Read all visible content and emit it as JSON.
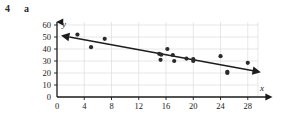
{
  "exercise": {
    "number": "4",
    "part": "a"
  },
  "chart_data": {
    "type": "scatter",
    "title": "",
    "xlabel": "x",
    "ylabel": "y",
    "xlim": [
      0,
      29.5
    ],
    "ylim": [
      0,
      60
    ],
    "grid": true,
    "legend": null,
    "xticks": [
      0,
      4,
      8,
      12,
      16,
      20,
      24,
      28
    ],
    "yticks": [
      0,
      10,
      20,
      30,
      40,
      50,
      60
    ],
    "xticklabels": [
      "0",
      "4",
      "8",
      "12",
      "16",
      "20",
      "24",
      "28"
    ],
    "yticklabels": [
      "0",
      "10",
      "20",
      "30",
      "40",
      "50",
      "60"
    ],
    "points": [
      {
        "x": 3.0,
        "y": 52.0
      },
      {
        "x": 5.0,
        "y": 41.5
      },
      {
        "x": 7.0,
        "y": 48.5
      },
      {
        "x": 15.0,
        "y": 36.0
      },
      {
        "x": 15.3,
        "y": 35.3
      },
      {
        "x": 15.2,
        "y": 31.0
      },
      {
        "x": 16.2,
        "y": 40.0
      },
      {
        "x": 17.0,
        "y": 35.0
      },
      {
        "x": 17.2,
        "y": 30.0
      },
      {
        "x": 19.0,
        "y": 32.0
      },
      {
        "x": 20.0,
        "y": 31.5
      },
      {
        "x": 20.0,
        "y": 30.0
      },
      {
        "x": 24.0,
        "y": 34.0
      },
      {
        "x": 25.0,
        "y": 21.0
      },
      {
        "x": 25.0,
        "y": 20.0
      },
      {
        "x": 28.0,
        "y": 28.5
      }
    ],
    "trendline": {
      "name": "line-of-best-fit",
      "x1": 1.8,
      "y1": 50.0,
      "x2": 28.8,
      "y2": 21.8,
      "arrow_start": true,
      "arrow_end": true
    },
    "colors": {
      "point": "#2a2a2a",
      "line": "#1d1d1d",
      "grid": "#dcdcdc",
      "axis": "#1a1a1a"
    }
  }
}
